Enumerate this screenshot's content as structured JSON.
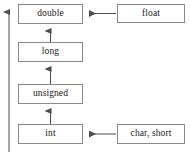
{
  "diagram": {
    "type": "flow-diagram",
    "background_color": "#ffffff",
    "box_border_color": "#8a8a8a",
    "arrow_color": "#4d4d4d",
    "text_color": "#1a1a1a",
    "nodes": [
      {
        "id": "double",
        "label": "double",
        "x": 18,
        "y": 4,
        "w": 65,
        "h": 20
      },
      {
        "id": "float",
        "label": "float",
        "x": 117,
        "y": 4,
        "w": 68,
        "h": 19
      },
      {
        "id": "long",
        "label": "long",
        "x": 18,
        "y": 42,
        "w": 65,
        "h": 20
      },
      {
        "id": "unsigned",
        "label": "unsigned",
        "x": 18,
        "y": 84,
        "w": 65,
        "h": 20
      },
      {
        "id": "int",
        "label": "int",
        "x": 18,
        "y": 124,
        "w": 65,
        "h": 20
      },
      {
        "id": "char_short",
        "label": "char, short",
        "x": 117,
        "y": 124,
        "w": 68,
        "h": 20
      }
    ],
    "edges": [
      {
        "id": "float-to-double",
        "from": "float",
        "to": "double",
        "direction": "left"
      },
      {
        "id": "long-to-double",
        "from": "long",
        "to": "double",
        "direction": "up"
      },
      {
        "id": "unsigned-to-long",
        "from": "unsigned",
        "to": "long",
        "direction": "up"
      },
      {
        "id": "int-to-unsigned",
        "from": "int",
        "to": "unsigned",
        "direction": "up"
      },
      {
        "id": "charshort-to-int",
        "from": "char, short",
        "to": "int",
        "direction": "left"
      },
      {
        "id": "overall-promotion",
        "from": "bottom",
        "to": "top",
        "direction": "up"
      }
    ]
  }
}
